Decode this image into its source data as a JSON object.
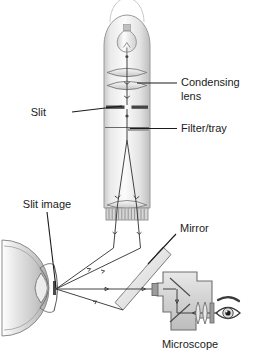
{
  "figure": {
    "background": "#ffffff",
    "ink": "#1b1b1b",
    "line_gray": "#8e8e8e",
    "ray_gray": "#3a3a3a",
    "body_fill_light": "#f1f1f1",
    "body_fill_mid": "#d9d9d9",
    "body_fill_dark": "#b4b4b4",
    "slit_bar_color": "#4a4a4a",
    "caption_partial": ""
  },
  "labels": {
    "condensing_lens": "Condensing\nlens",
    "condensing_lens_line1": "Condensing",
    "condensing_lens_line2": "lens",
    "slit": "Slit",
    "filter_tray": "Filter/tray",
    "slit_image": "Slit image",
    "mirror": "Mirror",
    "microscope": "Microscope"
  },
  "components": [
    {
      "name": "lamp-housing",
      "label": "",
      "description": "vertical illumination tube with domed top"
    },
    {
      "name": "lamp-bulb",
      "label": "",
      "description": "incandescent bulb inside housing"
    },
    {
      "name": "condensing-lens-upper",
      "label": "Condensing lens",
      "description": "upper biconvex condensing lens"
    },
    {
      "name": "condensing-lens-lower",
      "label": "Condensing lens",
      "description": "lower biconvex condensing lens"
    },
    {
      "name": "slit-aperture",
      "label": "Slit",
      "description": "two opposed dark bars forming adjustable slit"
    },
    {
      "name": "filter-tray",
      "label": "Filter/tray",
      "description": "horizontal filter tray slot"
    },
    {
      "name": "projection-lens",
      "label": "",
      "description": "projection objective lens near tube base"
    },
    {
      "name": "knurled-barrel",
      "label": "",
      "description": "ribbed focusing barrel at tube base"
    },
    {
      "name": "mirror",
      "label": "Mirror",
      "description": "45 degree plane mirror deflecting beam to eye"
    },
    {
      "name": "patient-eye",
      "label": "Slit image",
      "description": "cross-section of eye showing cornea, iris and crystalline lens"
    },
    {
      "name": "microscope-body",
      "label": "Microscope",
      "description": "binocular viewing microscope housing"
    },
    {
      "name": "microscope-mirror-top",
      "label": "",
      "description": "internal prism/mirror in microscope"
    },
    {
      "name": "microscope-mirror-bottom",
      "label": "",
      "description": "second internal prism/mirror in microscope"
    },
    {
      "name": "eyepiece-lenses",
      "label": "",
      "description": "eyepiece lens group"
    },
    {
      "name": "observer-eye",
      "label": "",
      "description": "observer eye icon at eyepiece"
    }
  ]
}
